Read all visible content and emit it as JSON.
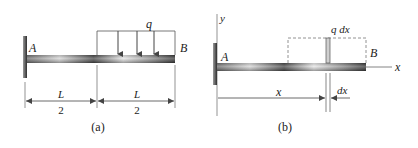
{
  "colors": {
    "line": "#555555",
    "text": "#222222",
    "wall_dark": "#3a3a3a",
    "wall_light": "#9a9a9a",
    "beam_dark": "#444444",
    "beam_light": "#e6e6e6",
    "load_line": "#444444",
    "dashed": "#777777"
  },
  "figure_a": {
    "caption": "(a)",
    "support_label": "A",
    "free_end_label": "B",
    "load_label": "q",
    "left_span": {
      "numerator": "L",
      "denominator": "2"
    },
    "right_span": {
      "numerator": "L",
      "denominator": "2"
    },
    "load_arrow_count": 3
  },
  "figure_b": {
    "caption": "(b)",
    "support_label": "A",
    "free_end_label": "B",
    "y_axis_label": "y",
    "x_axis_label": "x",
    "element_load_label": "q dx",
    "position_label": "x",
    "element_width_label": "dx"
  }
}
